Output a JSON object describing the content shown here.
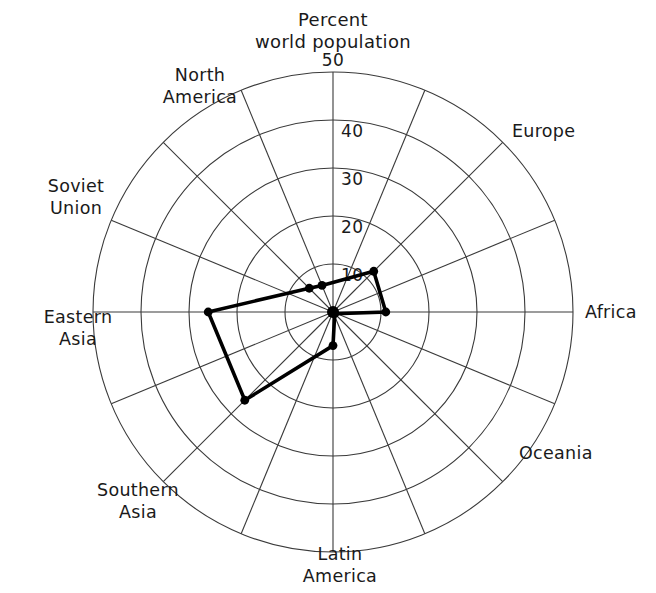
{
  "chart_data": {
    "type": "radar",
    "title_lines": [
      "Percent",
      "world population"
    ],
    "xlabel": "",
    "ylabel": "Percent world population",
    "grid": true,
    "legend": "none",
    "rlim": [
      0,
      50
    ],
    "rticks": [
      10,
      20,
      30,
      40,
      50
    ],
    "rtick_labels": [
      "10",
      "20",
      "30",
      "40",
      "50"
    ],
    "categories": [
      "Percent world population",
      "Europe",
      "Africa",
      "Oceania",
      "Latin America",
      "Southern Asia",
      "Eastern Asia",
      "Soviet Union",
      "North America"
    ],
    "axis_labels": [
      {
        "id": "axis-top",
        "lines": [
          "Percent",
          "world population"
        ],
        "angle_deg": 90
      },
      {
        "id": "axis-europe",
        "lines": [
          "Europe"
        ],
        "angle_deg": 45
      },
      {
        "id": "axis-africa",
        "lines": [
          "Africa"
        ],
        "angle_deg": 0
      },
      {
        "id": "axis-oceania",
        "lines": [
          "Oceania"
        ],
        "angle_deg": -45
      },
      {
        "id": "axis-latin-america",
        "lines": [
          "Latin",
          "America"
        ],
        "angle_deg": -90
      },
      {
        "id": "axis-southern-asia",
        "lines": [
          "Southern",
          "Asia"
        ],
        "angle_deg": -135
      },
      {
        "id": "axis-eastern-asia",
        "lines": [
          "Eastern",
          "Asia"
        ],
        "angle_deg": 180
      },
      {
        "id": "axis-soviet-union",
        "lines": [
          "Soviet",
          "Union"
        ],
        "angle_deg": 135
      },
      {
        "id": "axis-north-america",
        "lines": [
          "North",
          "America"
        ],
        "angle_deg": 112.5
      }
    ],
    "series": [
      {
        "name": "Percent world population",
        "points": [
          {
            "category": "Europe",
            "angle_deg": 45,
            "value": 12
          },
          {
            "category": "Africa",
            "angle_deg": 0,
            "value": 11
          },
          {
            "category": "Oceania",
            "angle_deg": -45,
            "value": 0.5
          },
          {
            "category": "Latin America",
            "angle_deg": -90,
            "value": 7
          },
          {
            "category": "Southern Asia",
            "angle_deg": -135,
            "value": 26
          },
          {
            "category": "Eastern Asia",
            "angle_deg": 180,
            "value": 26
          },
          {
            "category": "Soviet Union",
            "angle_deg": 135,
            "value": 7
          },
          {
            "category": "North America",
            "angle_deg": 112.5,
            "value": 6
          }
        ]
      }
    ]
  },
  "geometry": {
    "center_x": 333,
    "center_y": 312,
    "radius": 240,
    "rings": 5,
    "spoke_angles_deg": [
      90,
      67.5,
      45,
      22.5,
      0,
      -22.5,
      -45,
      -67.5,
      -90,
      -112.5,
      -135,
      -157.5,
      180,
      157.5,
      135,
      112.5
    ]
  },
  "colors": {
    "background": "#ffffff",
    "grid": "#3a3a3a",
    "series": "#000000",
    "text": "#1a1a1a"
  }
}
